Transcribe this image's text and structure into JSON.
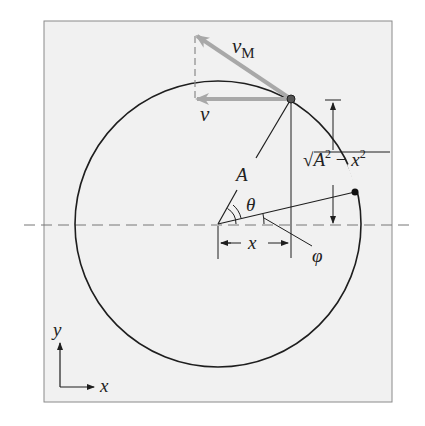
{
  "diagram": {
    "colors": {
      "background": "#ffffff",
      "panel": "#f1f1f1",
      "panel_border": "#8a8a8a",
      "line": "#1e1e1e",
      "vector": "#a8a8a8",
      "dashed": "#777777"
    },
    "labels": {
      "v_M_main": "v",
      "v_M_sub": "M",
      "v": "v",
      "A": "A",
      "theta": "θ",
      "phi": "φ",
      "x_dim": "x",
      "sqrt_sign": "√",
      "sqrt_A": "A",
      "sqrt_A_exp": "2",
      "sqrt_minus": " − ",
      "sqrt_x": "x",
      "sqrt_x_exp": "2",
      "axis_y": "y",
      "axis_x": "x"
    },
    "geometry": {
      "circle_center": [
        218,
        224
      ],
      "radius": 143,
      "reference_point": [
        291,
        99
      ],
      "initial_point": [
        355,
        192
      ],
      "angle_theta_deg": 59,
      "angle_phi_deg": 15
    }
  }
}
